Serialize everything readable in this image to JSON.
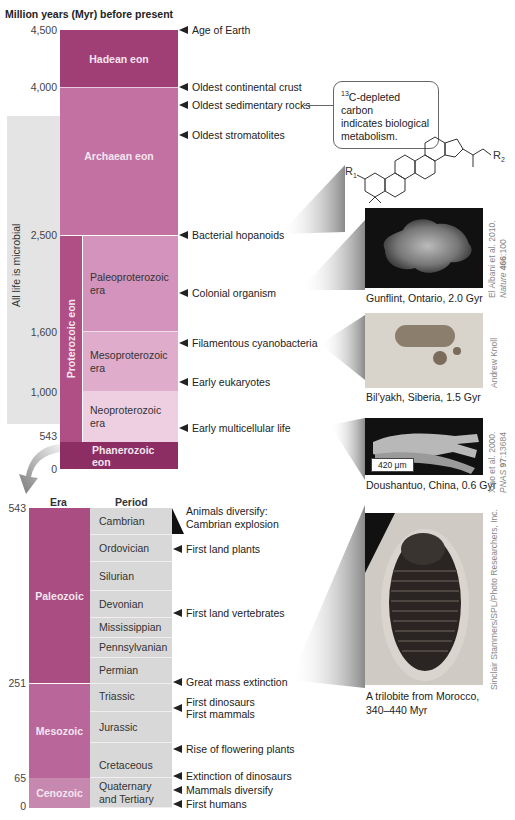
{
  "title": "Million years (Myr) before present",
  "upper_timeline": {
    "ticks": [
      {
        "label": "4,500",
        "myr": 4500
      },
      {
        "label": "4,000",
        "myr": 4000
      },
      {
        "label": "2,500",
        "myr": 2500
      },
      {
        "label": "1,600",
        "myr": 1600
      },
      {
        "label": "1,000",
        "myr": 1000
      },
      {
        "label": "543",
        "myr": 543
      },
      {
        "label": "0",
        "myr": 0
      }
    ],
    "microbial_band_label": "All life is microbial",
    "eons": [
      {
        "name": "Hadean eon",
        "start": 4500,
        "end": 4000,
        "color": "#a03e76"
      },
      {
        "name": "Archaean eon",
        "start": 4000,
        "end": 2500,
        "color": "#c370a2"
      },
      {
        "name": "Proterozoic eon",
        "start": 2500,
        "end": 543,
        "color": "#b04f86"
      },
      {
        "name": "Phanerozoic eon",
        "start": 543,
        "end": 0,
        "color": "#8c2e63"
      }
    ],
    "proterozoic_eras": [
      {
        "name": "Paleoproterozoic era",
        "line1": "Paleoproterozoic",
        "line2": "era",
        "start": 2500,
        "end": 1600,
        "color": "#d493bc"
      },
      {
        "name": "Mesoproterozoic era",
        "line1": "Mesoproterozoic",
        "line2": "era",
        "start": 1600,
        "end": 1000,
        "color": "#dfaccc"
      },
      {
        "name": "Neoproterozoic era",
        "line1": "Neoproterozoic",
        "line2": "era",
        "start": 1000,
        "end": 543,
        "color": "#eecfe1"
      }
    ],
    "phanerozoic_line1": "Phanerozoic",
    "phanerozoic_line2": "eon",
    "events": [
      "Age of Earth",
      "Oldest continental crust",
      "Oldest sedimentary rocks",
      "Oldest stromatolites",
      "Bacterial hopanoids",
      "Colonial organism",
      "Filamentous cyanobacteria",
      "Early eukaryotes",
      "Early multicellular life"
    ],
    "callout": {
      "superscript": "13",
      "line1": "C-depleted carbon",
      "line2": "indicates biological",
      "line3": "metabolism."
    },
    "molecule": {
      "r1": "R",
      "r1_sub": "1",
      "r2": "R",
      "r2_sub": "2"
    }
  },
  "fossils": [
    {
      "caption": "Gunflint, Ontario, 2.0 Gyr",
      "credit_line1": "El Albani et al. 2010.",
      "credit_line2_pre": "Nature ",
      "credit_line2_bold": "466",
      "credit_line2_post": ":100"
    },
    {
      "caption": "Bil'yakh, Siberia, 1.5 Gyr",
      "credit_line1": "Andrew Knoll"
    },
    {
      "caption": "Doushantuo, China, 0.6 Gyr",
      "scale_bar": "420 μm",
      "credit_line1": "Xiao et al. 2000.",
      "credit_line2_pre": "PNAS ",
      "credit_line2_bold": "97",
      "credit_line2_post": ":13684"
    },
    {
      "caption_line1": "A trilobite from Morocco,",
      "caption_line2": "340–440 Myr",
      "credit_line1": "Sinclair Stammers/SPL/Photo Researchers, Inc."
    }
  ],
  "lower_timeline": {
    "headers": {
      "era": "Era",
      "period": "Period"
    },
    "ticks": [
      {
        "label": "543",
        "myr": 543
      },
      {
        "label": "251",
        "myr": 251
      },
      {
        "label": "65",
        "myr": 65
      },
      {
        "label": "0",
        "myr": 0
      }
    ],
    "eras": [
      {
        "name": "Paleozoic",
        "start": 543,
        "end": 251,
        "color": "#a94d82"
      },
      {
        "name": "Mesozoic",
        "start": 251,
        "end": 65,
        "color": "#b9679a"
      },
      {
        "name": "Cenozoic",
        "start": 65,
        "end": 0,
        "color": "#c788b0"
      }
    ],
    "periods": [
      {
        "name": "Cambrian"
      },
      {
        "name": "Ordovician"
      },
      {
        "name": "Silurian"
      },
      {
        "name": "Devonian"
      },
      {
        "name": "Mississippian"
      },
      {
        "name": "Pennsylvanian"
      },
      {
        "name": "Permian"
      },
      {
        "name": "Triassic"
      },
      {
        "name": "Jurassic"
      },
      {
        "name": "Cretaceous"
      },
      {
        "name": "Quaternary and Tertiary",
        "line1": "Quaternary",
        "line2": "and Tertiary"
      }
    ],
    "events": {
      "cambrian_line1": "Animals diversify:",
      "cambrian_line2": "Cambrian explosion",
      "land_plants": "First land plants",
      "land_vertebrates": "First land vertebrates",
      "mass_extinction": "Great mass extinction",
      "dinosaurs": "First dinosaurs",
      "mammals": "First mammals",
      "flowering": "Rise of flowering plants",
      "dino_extinction": "Extinction of dinosaurs",
      "mammals_diversify": "Mammals diversify",
      "humans": "First humans"
    }
  }
}
